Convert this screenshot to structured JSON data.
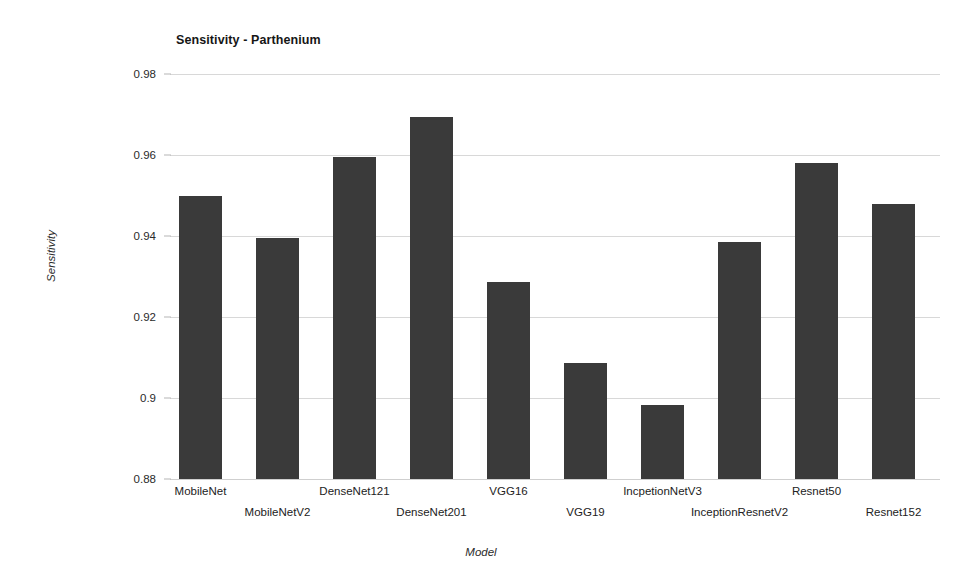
{
  "chart_data": {
    "type": "bar",
    "title": "Sensitivity - Parthenium",
    "xlabel": "Model",
    "ylabel": "Sensitivity",
    "ylim": [
      0.88,
      0.98
    ],
    "ytick_labels": [
      "0.98",
      "0.96",
      "0.94",
      "0.92",
      "0.9",
      "0.88"
    ],
    "ytick_values": [
      0.98,
      0.96,
      0.94,
      0.92,
      0.9,
      0.88
    ],
    "grid": true,
    "legend": null,
    "bar_color": "#3a3a3a",
    "categories": [
      "MobileNet",
      "MobileNetV2",
      "DenseNet121",
      "DenseNet201",
      "VGG16",
      "VGG19",
      "IncpetionNetV3",
      "InceptionResnetV2",
      "Resnet50",
      "Resnet152"
    ],
    "values": [
      0.95,
      0.9395,
      0.9595,
      0.9694,
      0.9286,
      0.9086,
      0.8983,
      0.9385,
      0.958,
      0.9479
    ]
  }
}
